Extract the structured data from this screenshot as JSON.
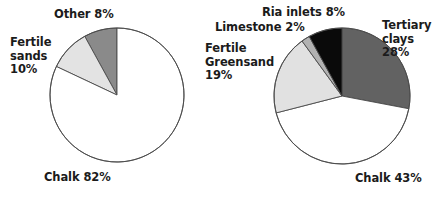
{
  "figure": {
    "title": "",
    "background": "#ffffff",
    "text_color": "#1b1b1b"
  },
  "chart_data": [
    {
      "id": "left-pie",
      "type": "pie",
      "title": "",
      "subtitle": "",
      "xlabel": "",
      "ylabel": "",
      "legend": "none",
      "grid": false,
      "start_angle_deg": 90,
      "direction": "counterclockwise",
      "center": {
        "cx": 117,
        "cy": 95,
        "r": 67
      },
      "categories": [
        "Other",
        "Fertile sands",
        "Chalk"
      ],
      "values": [
        8,
        10,
        82
      ],
      "colors": [
        "#8a8a8a",
        "#e3e3e3",
        "#ffffff"
      ],
      "stroke": "#4a4a4a",
      "labels": [
        {
          "name": "other",
          "text": "Other 8%",
          "lines": [
            "Other 8%"
          ],
          "x": 54,
          "y": 8,
          "align": "left"
        },
        {
          "name": "fertile-sands",
          "text": "Fertile sands 10%",
          "lines": [
            "Fertile",
            "sands",
            "10%"
          ],
          "x": 10,
          "y": 36,
          "align": "left"
        },
        {
          "name": "chalk",
          "text": "Chalk 82%",
          "lines": [
            "Chalk 82%"
          ],
          "x": 44,
          "y": 171,
          "align": "left"
        }
      ]
    },
    {
      "id": "right-pie",
      "type": "pie",
      "title": "",
      "subtitle": "",
      "xlabel": "",
      "ylabel": "",
      "legend": "none",
      "grid": false,
      "start_angle_deg": 90,
      "direction": "clockwise",
      "center": {
        "cx": 342,
        "cy": 96,
        "r": 68
      },
      "categories": [
        "Tertiary clays",
        "Chalk",
        "Fertile Greensand",
        "Limestone",
        "Ria inlets"
      ],
      "values": [
        28,
        43,
        19,
        2,
        8
      ],
      "colors": [
        "#626262",
        "#ffffff",
        "#e1e1e1",
        "#b2b2b2",
        "#0a0a0a"
      ],
      "stroke": "#4a4a4a",
      "labels": [
        {
          "name": "ria-inlets",
          "text": "Ria inlets 8%",
          "lines": [
            "Ria inlets 8%"
          ],
          "x": 262,
          "y": 6,
          "align": "left"
        },
        {
          "name": "limestone",
          "text": "Limestone 2%",
          "lines": [
            "Limestone 2%"
          ],
          "x": 215,
          "y": 21,
          "align": "left"
        },
        {
          "name": "fertile-greensand",
          "text": "Fertile Greensand 19%",
          "lines": [
            "Fertile",
            "Greensand",
            "19%"
          ],
          "x": 205,
          "y": 42,
          "align": "left"
        },
        {
          "name": "tertiary-clays",
          "text": "Tertiary clays 28%",
          "lines": [
            "Tertiary",
            "clays",
            "28%"
          ],
          "x": 382,
          "y": 19,
          "align": "left"
        },
        {
          "name": "chalk",
          "text": "Chalk 43%",
          "lines": [
            "Chalk 43%"
          ],
          "x": 355,
          "y": 172,
          "align": "left"
        }
      ]
    }
  ]
}
